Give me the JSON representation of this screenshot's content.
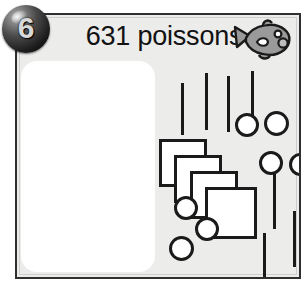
{
  "exercise": {
    "number": "6",
    "title": "631 poissons",
    "badge_icon": "numbered-bullet-icon",
    "fish_icon": "fish-icon"
  },
  "answer_box": {
    "value": "",
    "placeholder": ""
  },
  "chart_data": {
    "type": "table",
    "title": "631 poissons",
    "xlabel": "",
    "ylabel": "",
    "legend": [
      "carrés (centaines)",
      "barres (dizaines)",
      "ronds (unités)"
    ],
    "categories": [
      "squares",
      "sticks",
      "circles"
    ],
    "values": [
      4,
      6,
      7
    ],
    "annotations": [
      "Représentation en base dix : 4 carrés, 6 barres, 7 ronds"
    ]
  },
  "shapes": {
    "sticks": [
      {
        "left": 24,
        "top": 22,
        "height": 52
      },
      {
        "left": 48,
        "top": 12,
        "height": 57
      },
      {
        "left": 70,
        "top": 15,
        "height": 56
      },
      {
        "left": 94,
        "top": 10,
        "height": 57
      },
      {
        "left": 116,
        "top": 110,
        "height": 58
      },
      {
        "left": 106,
        "top": 172,
        "height": 58
      },
      {
        "left": 136,
        "top": 150,
        "height": 56
      }
    ],
    "squares": [
      {
        "left": 2,
        "top": 78,
        "size": 48
      },
      {
        "left": 17,
        "top": 94,
        "size": 48
      },
      {
        "left": 33,
        "top": 110,
        "size": 48
      },
      {
        "left": 48,
        "top": 126,
        "size": 52
      }
    ],
    "circles": [
      {
        "left": 78,
        "top": 52,
        "size": 24
      },
      {
        "left": 107,
        "top": 50,
        "size": 25
      },
      {
        "left": 102,
        "top": 90,
        "size": 24
      },
      {
        "left": 132,
        "top": 92,
        "size": 23
      },
      {
        "left": 17,
        "top": 135,
        "size": 24
      },
      {
        "left": 38,
        "top": 156,
        "size": 24
      },
      {
        "left": 12,
        "top": 175,
        "size": 25
      }
    ]
  }
}
